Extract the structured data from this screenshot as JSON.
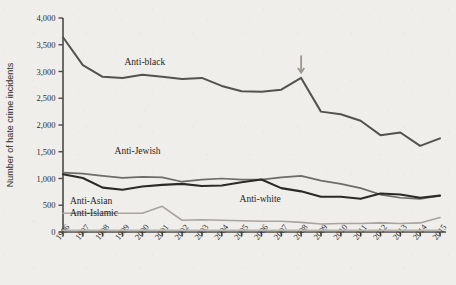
{
  "chart_data": {
    "type": "line",
    "title": "",
    "xlabel": "",
    "ylabel": "Number of hate crime incidents",
    "x": [
      1996,
      1997,
      1998,
      1999,
      2000,
      2001,
      2002,
      2003,
      2004,
      2005,
      2006,
      2007,
      2008,
      2009,
      2010,
      2011,
      2012,
      2013,
      2014,
      2015
    ],
    "categories": [
      "1996",
      "1997",
      "1998",
      "1999",
      "2000",
      "2001",
      "2002",
      "2003",
      "2004",
      "2005",
      "2006",
      "2007",
      "2008",
      "2009",
      "2010",
      "2011",
      "2012",
      "2013",
      "2014",
      "2015"
    ],
    "ylim": [
      0,
      4000
    ],
    "yticks": [
      0,
      500,
      1000,
      1500,
      2000,
      2500,
      3000,
      3500,
      4000
    ],
    "ytick_labels": [
      "0",
      "500",
      "1,000",
      "1,500",
      "2,000",
      "2,500",
      "3,000",
      "3,500",
      "4,000"
    ],
    "grid": false,
    "legend": "inline-labels",
    "series": [
      {
        "name": "Anti-black",
        "color": "#53524e",
        "width": 2.0,
        "label_x": 1999.1,
        "label_y": 3120,
        "values": [
          3640,
          3120,
          2900,
          2880,
          2940,
          2900,
          2860,
          2880,
          2730,
          2630,
          2620,
          2660,
          2880,
          2250,
          2200,
          2080,
          1810,
          1860,
          1610,
          1750
        ]
      },
      {
        "name": "Anti-Jewish",
        "color": "#6d6c67",
        "width": 1.7,
        "label_x": 1998.6,
        "label_y": 1450,
        "values": [
          1110,
          1090,
          1050,
          1010,
          1030,
          1020,
          940,
          980,
          1000,
          980,
          980,
          1020,
          1050,
          960,
          900,
          820,
          700,
          640,
          620,
          680
        ]
      },
      {
        "name": "Anti-white",
        "color": "#2b2a27",
        "width": 2.1,
        "label_x": 2004.9,
        "label_y": 560,
        "values": [
          1080,
          1010,
          830,
          790,
          850,
          880,
          900,
          860,
          870,
          930,
          980,
          820,
          760,
          660,
          660,
          620,
          720,
          700,
          640,
          680
        ]
      },
      {
        "name": "Anti-Asian",
        "color": "#a7a59d",
        "width": 1.6,
        "label_x": 1996.35,
        "label_y": 530,
        "values": [
          350,
          350,
          350,
          350,
          350,
          480,
          220,
          230,
          220,
          210,
          200,
          200,
          180,
          150,
          160,
          160,
          170,
          160,
          170,
          270
        ]
      },
      {
        "name": "Anti-Islamic",
        "color": "#b8b6ae",
        "width": 1.6,
        "label_x": 1996.35,
        "label_y": 300,
        "values": [
          30,
          30,
          30,
          30,
          30,
          30,
          30,
          30,
          30,
          30,
          30,
          30,
          30,
          30,
          30,
          30,
          30,
          30,
          30,
          30
        ]
      }
    ],
    "annotations": [
      {
        "name": "arrow-2008",
        "kind": "down-arrow",
        "x": 2008,
        "y_top": 3300,
        "y_tip": 2980,
        "color": "#9a988f"
      }
    ]
  }
}
